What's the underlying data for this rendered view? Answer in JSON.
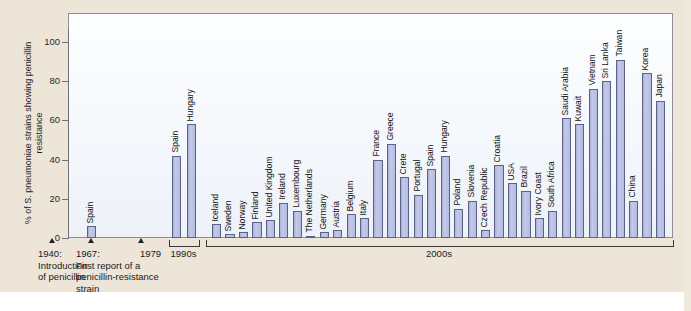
{
  "chart_data": {
    "type": "bar",
    "title": "",
    "xlabel": "",
    "ylabel": "% of S. pneumoniae strains showing penicillin resistance",
    "ylim": [
      0,
      108
    ],
    "yticks": [
      0,
      20,
      40,
      60,
      80,
      100
    ],
    "grid": false,
    "legend": null,
    "categories": [
      "Spain",
      "Spain",
      "Hungary",
      "Iceland",
      "Sweden",
      "Norway",
      "Finland",
      "United Kingdom",
      "Ireland",
      "Luxembourg",
      "The Netherlands",
      "Germany",
      "Austria",
      "Belgium",
      "Italy",
      "France",
      "Greece",
      "Crete",
      "Portugal",
      "Spain",
      "Hungary",
      "Poland",
      "Slovenia",
      "Czech Republic",
      "Croatia",
      "USA",
      "Brazil",
      "Ivory Coast",
      "South Africa",
      "Saudi Arabia",
      "Kuwait",
      "Vietnam",
      "Sri Lanka",
      "Taiwan",
      "China",
      "Korea",
      "Japan"
    ],
    "values": [
      6,
      42,
      58,
      7,
      2,
      3,
      8,
      9,
      18,
      14,
      1,
      3,
      4,
      12,
      10,
      40,
      48,
      31,
      22,
      35,
      42,
      15,
      19,
      4,
      37,
      28,
      24,
      10,
      14,
      61,
      58,
      76,
      80,
      91,
      19,
      84,
      70
    ],
    "groups": [
      {
        "label": "1979",
        "start": 0,
        "count": 1,
        "bracket": false
      },
      {
        "label": "1990s",
        "start": 1,
        "count": 2,
        "bracket": true
      },
      {
        "label": "2000s",
        "start": 3,
        "count": 34,
        "bracket": true
      }
    ],
    "annotations": [
      {
        "label": "1940:\nIntroduction\nof penicillin",
        "year": 1940
      },
      {
        "label": "1967:\nFirst report of a\npenicillin-resistance\nstrain",
        "year": 1967
      },
      {
        "label": "1979",
        "year": 1979
      }
    ],
    "colors": {
      "bar_fill": "#b9c0e2",
      "bar_edge": "#5a6287",
      "plot_background": "#f7fafd",
      "page_background": "#ece5d8",
      "axis": "#6f7176",
      "text": "#1b1b1b"
    }
  },
  "timeline": {
    "marker_1940": "1940:\nIntroduction\nof penicillin",
    "marker_1967": "1967:\nFirst report of a\npenicillin-resistance\nstrain",
    "marker_1979": "1979",
    "bracket_1990s": "1990s",
    "bracket_2000s": "2000s"
  }
}
